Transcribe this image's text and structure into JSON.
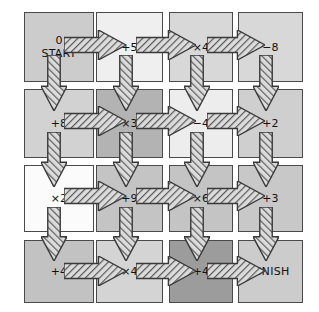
{
  "diagram": {
    "type": "grid-maze",
    "rows": 4,
    "cols": 4,
    "colors": {
      "border": "#4a4a4a",
      "arrow_outline": "#3a3a3a",
      "arrow_fill": "#cfcfcf",
      "text": "#111111",
      "background": "#ffffff",
      "shade_white": "#fbfbfb",
      "shade_lightest": "#efefef",
      "shade_light": "#e2e2e2",
      "shade_medium": "#cccccc",
      "shade_dark": "#b3b3b3",
      "shade_darkest": "#9c9c9c"
    },
    "cells": [
      {
        "id": "r1c1",
        "row": 1,
        "col": 1,
        "lines": [
          "0",
          "START"
        ],
        "shade": "#cccccc",
        "x": 24,
        "y": 12,
        "w": 70,
        "h": 70
      },
      {
        "id": "r1c2",
        "row": 1,
        "col": 2,
        "lines": [
          "+5"
        ],
        "shade": "#efefef",
        "x": 96,
        "y": 12,
        "w": 67,
        "h": 70
      },
      {
        "id": "r1c3",
        "row": 1,
        "col": 3,
        "lines": [
          "×4"
        ],
        "shade": "#d8d8d8",
        "x": 169,
        "y": 12,
        "w": 64,
        "h": 70
      },
      {
        "id": "r1c4",
        "row": 1,
        "col": 4,
        "lines": [
          "−8"
        ],
        "shade": "#d8d8d8",
        "x": 238,
        "y": 12,
        "w": 65,
        "h": 70
      },
      {
        "id": "r2c1",
        "row": 2,
        "col": 1,
        "lines": [
          "+8"
        ],
        "shade": "#d2d2d2",
        "x": 24,
        "y": 89,
        "w": 70,
        "h": 69
      },
      {
        "id": "r2c2",
        "row": 2,
        "col": 2,
        "lines": [
          "×3"
        ],
        "shade": "#b3b3b3",
        "x": 96,
        "y": 89,
        "w": 67,
        "h": 69
      },
      {
        "id": "r2c3",
        "row": 2,
        "col": 3,
        "lines": [
          "−4"
        ],
        "shade": "#ededed",
        "x": 169,
        "y": 89,
        "w": 64,
        "h": 69
      },
      {
        "id": "r2c4",
        "row": 2,
        "col": 4,
        "lines": [
          "+2"
        ],
        "shade": "#cfcfcf",
        "x": 238,
        "y": 89,
        "w": 65,
        "h": 69
      },
      {
        "id": "r3c1",
        "row": 3,
        "col": 1,
        "lines": [
          "×2"
        ],
        "shade": "#fbfbfb",
        "x": 24,
        "y": 165,
        "w": 70,
        "h": 67
      },
      {
        "id": "r3c2",
        "row": 3,
        "col": 2,
        "lines": [
          "+9"
        ],
        "shade": "#c4c4c4",
        "x": 96,
        "y": 165,
        "w": 67,
        "h": 67
      },
      {
        "id": "r3c3",
        "row": 3,
        "col": 3,
        "lines": [
          "×6"
        ],
        "shade": "#c4c4c4",
        "x": 169,
        "y": 165,
        "w": 64,
        "h": 67
      },
      {
        "id": "r3c4",
        "row": 3,
        "col": 4,
        "lines": [
          "+3"
        ],
        "shade": "#c8c8c8",
        "x": 238,
        "y": 165,
        "w": 65,
        "h": 67
      },
      {
        "id": "r4c1",
        "row": 4,
        "col": 1,
        "lines": [
          "+4"
        ],
        "shade": "#c2c2c2",
        "x": 24,
        "y": 240,
        "w": 70,
        "h": 63
      },
      {
        "id": "r4c2",
        "row": 4,
        "col": 2,
        "lines": [
          "×4"
        ],
        "shade": "#d4d4d4",
        "x": 96,
        "y": 240,
        "w": 67,
        "h": 63
      },
      {
        "id": "r4c3",
        "row": 4,
        "col": 3,
        "lines": [
          "+4"
        ],
        "shade": "#9c9c9c",
        "x": 169,
        "y": 240,
        "w": 64,
        "h": 63
      },
      {
        "id": "r4c4",
        "row": 4,
        "col": 4,
        "lines": [
          "FINISH"
        ],
        "shade": "#cccccc",
        "x": 238,
        "y": 240,
        "w": 65,
        "h": 63
      }
    ],
    "arrows": [
      {
        "id": "a-r1c1-right",
        "dir": "right",
        "from": "r1c1",
        "to": "r1c2",
        "x": 64,
        "y": 30,
        "len": 62,
        "thick": 30
      },
      {
        "id": "a-r1c2-right",
        "dir": "right",
        "from": "r1c2",
        "to": "r1c3",
        "x": 136,
        "y": 30,
        "len": 60,
        "thick": 30
      },
      {
        "id": "a-r1c3-right",
        "dir": "right",
        "from": "r1c3",
        "to": "r1c4",
        "x": 207,
        "y": 30,
        "len": 58,
        "thick": 30
      },
      {
        "id": "a-r1c1-down",
        "dir": "down",
        "from": "r1c1",
        "to": "r2c1",
        "x": 41,
        "y": 55,
        "len": 56,
        "thick": 26
      },
      {
        "id": "a-r1c2-down",
        "dir": "down",
        "from": "r1c2",
        "to": "r2c2",
        "x": 113,
        "y": 55,
        "len": 56,
        "thick": 26
      },
      {
        "id": "a-r1c3-down",
        "dir": "down",
        "from": "r1c3",
        "to": "r2c3",
        "x": 184,
        "y": 55,
        "len": 56,
        "thick": 26
      },
      {
        "id": "a-r1c4-down",
        "dir": "down",
        "from": "r1c4",
        "to": "r2c4",
        "x": 253,
        "y": 55,
        "len": 56,
        "thick": 26
      },
      {
        "id": "a-r2c1-right",
        "dir": "right",
        "from": "r2c1",
        "to": "r2c2",
        "x": 64,
        "y": 106,
        "len": 62,
        "thick": 30
      },
      {
        "id": "a-r2c2-right",
        "dir": "right",
        "from": "r2c2",
        "to": "r2c3",
        "x": 136,
        "y": 106,
        "len": 60,
        "thick": 30
      },
      {
        "id": "a-r2c3-right",
        "dir": "right",
        "from": "r2c3",
        "to": "r2c4",
        "x": 207,
        "y": 106,
        "len": 58,
        "thick": 30
      },
      {
        "id": "a-r2c1-down",
        "dir": "down",
        "from": "r2c1",
        "to": "r3c1",
        "x": 41,
        "y": 132,
        "len": 55,
        "thick": 26
      },
      {
        "id": "a-r2c2-down",
        "dir": "down",
        "from": "r2c2",
        "to": "r3c2",
        "x": 113,
        "y": 132,
        "len": 55,
        "thick": 26
      },
      {
        "id": "a-r2c3-down",
        "dir": "down",
        "from": "r2c3",
        "to": "r3c3",
        "x": 184,
        "y": 132,
        "len": 55,
        "thick": 26
      },
      {
        "id": "a-r2c4-down",
        "dir": "down",
        "from": "r2c4",
        "to": "r3c4",
        "x": 253,
        "y": 132,
        "len": 55,
        "thick": 26
      },
      {
        "id": "a-r3c1-right",
        "dir": "right",
        "from": "r3c1",
        "to": "r3c2",
        "x": 64,
        "y": 181,
        "len": 62,
        "thick": 30
      },
      {
        "id": "a-r3c2-right",
        "dir": "right",
        "from": "r3c2",
        "to": "r3c3",
        "x": 136,
        "y": 181,
        "len": 60,
        "thick": 30
      },
      {
        "id": "a-r3c3-right",
        "dir": "right",
        "from": "r3c3",
        "to": "r3c4",
        "x": 207,
        "y": 181,
        "len": 58,
        "thick": 30
      },
      {
        "id": "a-r3c1-down",
        "dir": "down",
        "from": "r3c1",
        "to": "r4c1",
        "x": 41,
        "y": 207,
        "len": 54,
        "thick": 26
      },
      {
        "id": "a-r3c2-down",
        "dir": "down",
        "from": "r3c2",
        "to": "r4c2",
        "x": 113,
        "y": 207,
        "len": 54,
        "thick": 26
      },
      {
        "id": "a-r3c3-down",
        "dir": "down",
        "from": "r3c3",
        "to": "r4c3",
        "x": 184,
        "y": 207,
        "len": 54,
        "thick": 26
      },
      {
        "id": "a-r3c4-down",
        "dir": "down",
        "from": "r3c4",
        "to": "r4c4",
        "x": 253,
        "y": 207,
        "len": 54,
        "thick": 26
      },
      {
        "id": "a-r4c1-right",
        "dir": "right",
        "from": "r4c1",
        "to": "r4c2",
        "x": 64,
        "y": 256,
        "len": 62,
        "thick": 30
      },
      {
        "id": "a-r4c2-right",
        "dir": "right",
        "from": "r4c2",
        "to": "r4c3",
        "x": 136,
        "y": 256,
        "len": 60,
        "thick": 30
      },
      {
        "id": "a-r4c3-right",
        "dir": "right",
        "from": "r4c3",
        "to": "r4c4",
        "x": 207,
        "y": 256,
        "len": 58,
        "thick": 30
      }
    ]
  }
}
